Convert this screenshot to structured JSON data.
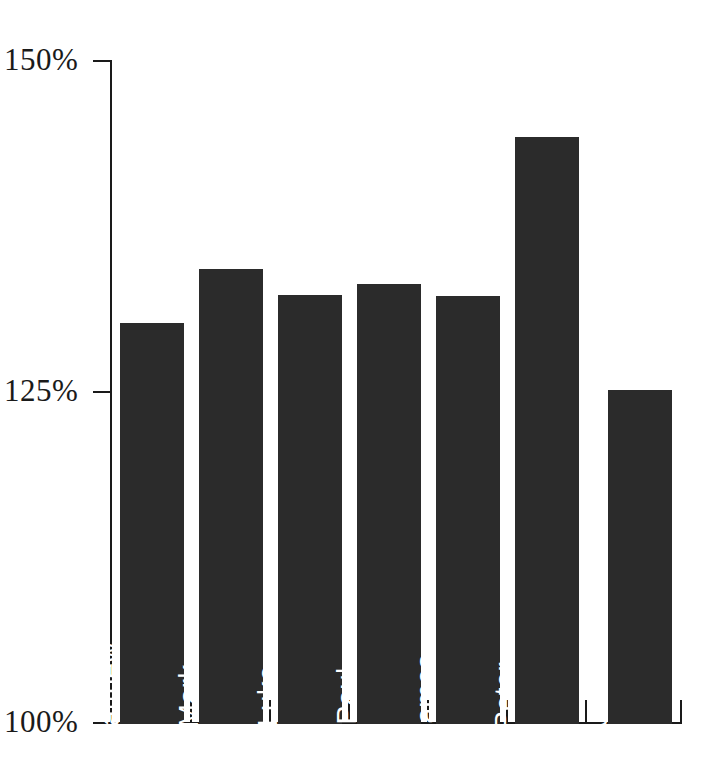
{
  "chart_data": {
    "type": "bar",
    "title": "",
    "subtitle": "",
    "xlabel": "",
    "ylabel": "",
    "categories": [
      "Matthew",
      "Mark",
      "Luke",
      "Paul",
      "James",
      "Peter",
      "John"
    ],
    "values": [
      130.3,
      134.4,
      132.4,
      133.2,
      132.3,
      144.3,
      125.2
    ],
    "series": [
      {
        "name": "",
        "values": [
          130.3,
          134.4,
          132.4,
          133.2,
          132.3,
          144.3,
          125.2
        ]
      }
    ],
    "ylim": [
      100,
      150
    ],
    "ytick_values": [
      100,
      125,
      150
    ],
    "ytick_labels": [
      "100%",
      "125%",
      "150%"
    ],
    "xtick_labels": [],
    "grid": false,
    "legend": null,
    "legend_position": "none",
    "bar_color": "#2b2b2b",
    "bar_label_color": "#ffffff",
    "axis_color": "#1a1a1a",
    "background_color": "#ffffff",
    "bar_label_orientation": "vertical-bottom-to-top",
    "annotations": []
  },
  "axis": {
    "y_ticks": [
      {
        "label": "150%",
        "value": 150
      },
      {
        "label": "125%",
        "value": 125
      },
      {
        "label": "100%",
        "value": 100
      }
    ]
  },
  "bars": [
    {
      "label": "Matthew",
      "value": 130.3
    },
    {
      "label": "Mark",
      "value": 134.4
    },
    {
      "label": "Luke",
      "value": 132.4
    },
    {
      "label": "Paul",
      "value": 133.2
    },
    {
      "label": "James",
      "value": 132.3
    },
    {
      "label": "Peter",
      "value": 144.3
    },
    {
      "label": "John",
      "value": 125.2
    }
  ]
}
